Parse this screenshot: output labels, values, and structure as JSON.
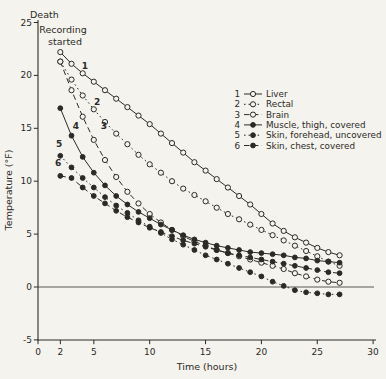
{
  "figure": {
    "background": "#f5f3ed",
    "ink": "#2b2a27",
    "death_label": "Death",
    "annotation_line1": "Recording",
    "annotation_line2": "started"
  },
  "chart_data": {
    "type": "line",
    "title": "",
    "xlabel": "Time (hours)",
    "ylabel": "Temperature (°F)",
    "xlim": [
      0,
      30
    ],
    "ylim": [
      -5,
      25
    ],
    "x_ticks": [
      0,
      2,
      5,
      10,
      15,
      20,
      25,
      30
    ],
    "y_ticks": [
      25,
      20,
      15,
      10,
      5,
      0,
      -5
    ],
    "grid": false,
    "zero_line": true,
    "legend_position": "upper right",
    "x": [
      2,
      3,
      4,
      5,
      6,
      7,
      8,
      9,
      10,
      11,
      12,
      13,
      14,
      15,
      16,
      17,
      18,
      19,
      20,
      21,
      22,
      23,
      24,
      25,
      26,
      27
    ],
    "series": [
      {
        "index": "1",
        "name": "Liver",
        "id": "liver",
        "marker": "open",
        "line": "solid",
        "label_pos": [
          4.2,
          20.6
        ],
        "values": [
          22.2,
          21.1,
          20.2,
          19.4,
          18.6,
          17.8,
          17.0,
          16.2,
          15.4,
          14.5,
          13.6,
          12.7,
          11.8,
          11.0,
          10.2,
          9.4,
          8.6,
          7.8,
          6.9,
          6.0,
          5.3,
          4.7,
          4.2,
          3.7,
          3.3,
          3.0
        ]
      },
      {
        "index": "2",
        "name": "Rectal",
        "id": "rectal",
        "marker": "open",
        "line": "dotted",
        "label_pos": [
          5.3,
          17.2
        ],
        "values": [
          21.3,
          19.6,
          18.1,
          16.8,
          15.6,
          14.5,
          13.5,
          12.5,
          11.6,
          10.8,
          10.0,
          9.3,
          8.7,
          8.1,
          7.5,
          6.9,
          6.4,
          5.9,
          5.4,
          4.9,
          4.4,
          3.9,
          3.4,
          2.9,
          2.4,
          2.0
        ]
      },
      {
        "index": "3",
        "name": "Brain",
        "id": "brain",
        "marker": "open",
        "line": "dashed",
        "label_pos": [
          5.9,
          14.9
        ],
        "values": [
          21.3,
          18.6,
          16.1,
          13.9,
          12.0,
          10.4,
          9.0,
          7.9,
          6.9,
          6.1,
          5.4,
          4.8,
          4.3,
          3.9,
          3.5,
          3.2,
          2.9,
          2.6,
          2.3,
          2.0,
          1.7,
          1.3,
          1.0,
          0.7,
          0.5,
          0.4
        ]
      },
      {
        "index": "4",
        "name": "Muscle, thigh, covered",
        "id": "muscle-thigh-covered",
        "marker": "filled",
        "line": "solid",
        "label_pos": [
          3.4,
          14.9
        ],
        "values": [
          16.9,
          14.3,
          12.3,
          10.8,
          9.6,
          8.6,
          7.8,
          7.1,
          6.5,
          5.9,
          5.4,
          4.9,
          4.5,
          4.2,
          3.9,
          3.7,
          3.5,
          3.3,
          3.2,
          3.1,
          3.0,
          2.8,
          2.7,
          2.5,
          2.4,
          2.3
        ]
      },
      {
        "index": "5",
        "name": "Skin, forehead, uncovered",
        "id": "skin-forehead-uncovered",
        "marker": "filled",
        "line": "dotted",
        "label_pos": [
          1.9,
          13.2
        ],
        "values": [
          12.4,
          11.3,
          10.3,
          9.4,
          8.5,
          7.7,
          7.0,
          6.3,
          5.7,
          5.1,
          4.5,
          4.0,
          3.5,
          3.0,
          2.6,
          2.2,
          1.8,
          1.4,
          1.0,
          0.5,
          0.1,
          -0.3,
          -0.5,
          -0.6,
          -0.7,
          -0.7
        ]
      },
      {
        "index": "6",
        "name": "Skin, chest, covered",
        "id": "skin-chest-covered",
        "marker": "filled",
        "line": "dashed",
        "label_pos": [
          1.8,
          11.4
        ],
        "values": [
          10.5,
          10.3,
          9.4,
          8.6,
          7.9,
          7.2,
          6.6,
          6.1,
          5.6,
          5.2,
          4.8,
          4.4,
          4.1,
          3.8,
          3.5,
          3.2,
          3.0,
          2.8,
          2.6,
          2.4,
          2.2,
          2.0,
          1.8,
          1.6,
          1.4,
          1.3
        ]
      }
    ]
  }
}
